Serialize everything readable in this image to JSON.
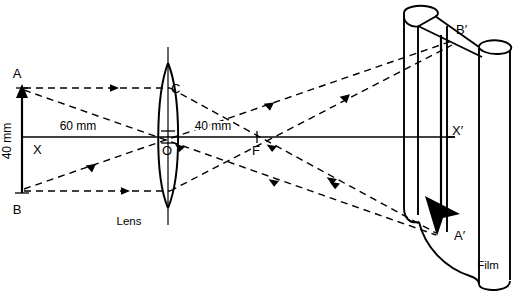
{
  "diagram": {
    "background_color": "#ffffff",
    "stroke_color": "#000000",
    "labels": {
      "object_top": "A",
      "object_bottom": "B",
      "axis_left": "X",
      "axis_right": "X′",
      "lens_center": "O",
      "lens_top_ray_point": "C",
      "focal_point": "F",
      "image_top": "B′",
      "image_bottom": "A′",
      "lens_caption": "Lens",
      "film_caption": "Film"
    },
    "dimensions": {
      "object_distance": "60 mm",
      "focal_length": "40 mm",
      "object_height": "40 mm"
    },
    "optics": {
      "object_distance_mm": 60,
      "focal_length_mm": 40,
      "object_height_mm": 40,
      "image_orientation": "inverted"
    }
  },
  "geometry": {
    "axis_y": 137,
    "object_x": 22,
    "object_top_y": 88,
    "object_bottom_y": 193,
    "lens_center_x": 168,
    "lens_top_y": 63,
    "lens_bottom_y": 208,
    "focal_x": 257,
    "image_plane_x": 413,
    "image_top_y": 33,
    "image_bottom_y": 232
  }
}
